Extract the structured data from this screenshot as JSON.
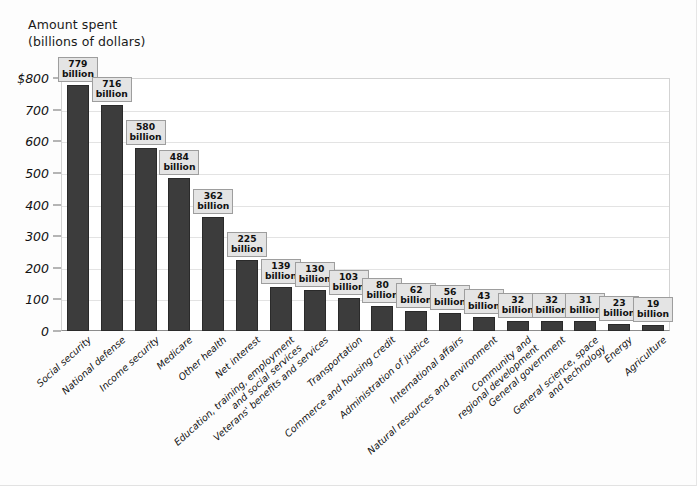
{
  "chart_data": {
    "type": "bar",
    "title_lines": [
      "Amount spent",
      "(billions of dollars)"
    ],
    "xlabel": "",
    "ylabel": "Amount spent (billions of dollars)",
    "ylim": [
      0,
      800
    ],
    "grid": true,
    "legend": "none",
    "bar_color": "#3c3c3c",
    "value_label_unit": "billion",
    "yticks": [
      "0",
      "100",
      "200",
      "300",
      "400",
      "500",
      "600",
      "700",
      "$800"
    ],
    "ytick_values": [
      0,
      100,
      200,
      300,
      400,
      500,
      600,
      700,
      800
    ],
    "categories": [
      "Social security",
      "National defense",
      "Income security",
      "Medicare",
      "Other health",
      "Net interest",
      "Education, training, employment and social services",
      "Veterans' benefits and services",
      "Transportation",
      "Commerce and housing credit",
      "Administration of justice",
      "International affairs",
      "Natural resources and environment",
      "Community and regional development",
      "General government",
      "General science, space and technology",
      "Energy",
      "Agriculture"
    ],
    "category_lines": [
      [
        "Social security"
      ],
      [
        "National defense"
      ],
      [
        "Income security"
      ],
      [
        "Medicare"
      ],
      [
        "Other health"
      ],
      [
        "Net interest"
      ],
      [
        "Education, training, employment",
        "and social services"
      ],
      [
        "Veterans' benefits and services"
      ],
      [
        "Transportation"
      ],
      [
        "Commerce and housing credit"
      ],
      [
        "Administration of justice"
      ],
      [
        "International affairs"
      ],
      [
        "Natural resources and environment"
      ],
      [
        "Community and",
        "regional development"
      ],
      [
        "General government"
      ],
      [
        "General science, space",
        "and technology"
      ],
      [
        "Energy"
      ],
      [
        "Agriculture"
      ]
    ],
    "values": [
      779,
      716,
      580,
      484,
      362,
      225,
      139,
      130,
      103,
      80,
      62,
      56,
      43,
      32,
      32,
      31,
      23,
      19
    ],
    "value_labels": [
      "779 billion",
      "716 billion",
      "580 billion",
      "484 billion",
      "362 billion",
      "225 billion",
      "139 billion",
      "130 billion",
      "103 billion",
      "80 billion",
      "62 billion",
      "56 billion",
      "43 billion",
      "32 billion",
      "32 billion",
      "31 billion",
      "23 billion",
      "19 billion"
    ]
  }
}
